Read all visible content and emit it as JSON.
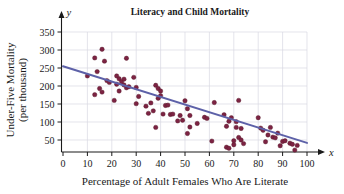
{
  "figure": {
    "width": 344,
    "height": 194,
    "background": "#ffffff"
  },
  "chart_data": {
    "type": "scatter",
    "title": "Literacy and Child Mortality",
    "xlabel": "Percentage of Adult Females Who Are Literate",
    "ylabel_line1": "Under-Five Mortality",
    "ylabel_line2": "(per thousand)",
    "x_axis_name": "x",
    "y_axis_name": "y",
    "xlim": [
      0,
      100
    ],
    "ylim": [
      0,
      375
    ],
    "xticks": [
      0,
      10,
      20,
      30,
      40,
      50,
      60,
      70,
      80,
      90,
      100
    ],
    "yticks": [
      50,
      100,
      150,
      200,
      250,
      300,
      350
    ],
    "xtick_labels": [
      "0",
      "10",
      "20",
      "30",
      "40",
      "50",
      "60",
      "70",
      "80",
      "90",
      "100"
    ],
    "ytick_labels": [
      "50",
      "100",
      "150",
      "200",
      "250",
      "300",
      "350"
    ],
    "grid": true,
    "legend": "none",
    "point_color": "#7c2343",
    "line_color": "#5d61a8",
    "grid_color": "#d9d9e2",
    "axis_color": "#1a1a1a",
    "trendline": {
      "type": "linear",
      "x_start": 0,
      "y_start": 255,
      "x_end": 100,
      "y_end": 42
    },
    "points": [
      [
        10,
        228
      ],
      [
        13,
        278
      ],
      [
        13,
        176
      ],
      [
        14,
        240
      ],
      [
        15,
        193
      ],
      [
        16,
        302
      ],
      [
        16,
        183
      ],
      [
        17,
        269
      ],
      [
        18,
        215
      ],
      [
        19,
        210
      ],
      [
        21,
        160
      ],
      [
        22,
        205
      ],
      [
        22,
        228
      ],
      [
        23,
        220
      ],
      [
        23,
        186
      ],
      [
        24,
        212
      ],
      [
        25,
        219
      ],
      [
        25,
        203
      ],
      [
        26,
        277
      ],
      [
        26,
        195
      ],
      [
        27,
        198
      ],
      [
        29,
        224
      ],
      [
        30,
        196
      ],
      [
        30,
        151
      ],
      [
        31,
        171
      ],
      [
        34,
        144
      ],
      [
        35,
        124
      ],
      [
        36,
        153
      ],
      [
        37,
        131
      ],
      [
        38,
        85
      ],
      [
        38,
        202
      ],
      [
        39,
        193
      ],
      [
        39,
        166
      ],
      [
        40,
        173
      ],
      [
        40,
        186
      ],
      [
        41,
        122
      ],
      [
        42,
        146
      ],
      [
        43,
        147
      ],
      [
        44,
        121
      ],
      [
        45,
        122
      ],
      [
        47,
        103
      ],
      [
        48,
        118
      ],
      [
        49,
        105
      ],
      [
        50,
        159
      ],
      [
        51,
        137
      ],
      [
        51,
        68
      ],
      [
        52,
        118
      ],
      [
        52,
        86
      ],
      [
        55,
        96
      ],
      [
        58,
        113
      ],
      [
        59,
        110
      ],
      [
        61,
        47
      ],
      [
        62,
        154
      ],
      [
        66,
        120
      ],
      [
        67,
        88
      ],
      [
        67,
        30
      ],
      [
        68,
        27
      ],
      [
        68,
        102
      ],
      [
        69,
        112
      ],
      [
        70,
        48
      ],
      [
        70,
        37
      ],
      [
        71,
        101
      ],
      [
        71,
        85
      ],
      [
        72,
        57
      ],
      [
        72,
        160
      ],
      [
        73,
        50
      ],
      [
        73,
        82
      ],
      [
        74,
        40
      ],
      [
        80,
        112
      ],
      [
        81,
        83
      ],
      [
        82,
        77
      ],
      [
        83,
        45
      ],
      [
        84,
        64
      ],
      [
        85,
        85
      ],
      [
        86,
        58
      ],
      [
        87,
        56
      ],
      [
        88,
        69
      ],
      [
        89,
        34
      ],
      [
        90,
        46
      ],
      [
        91,
        48
      ],
      [
        93,
        41
      ],
      [
        94,
        38
      ],
      [
        95,
        22
      ],
      [
        96,
        35
      ]
    ]
  }
}
